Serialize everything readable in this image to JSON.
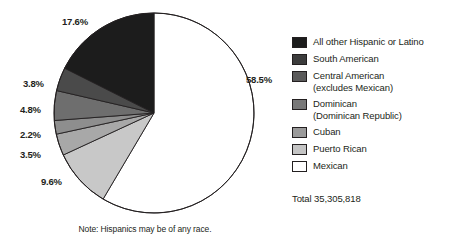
{
  "chart_data": {
    "type": "pie",
    "title": "",
    "subtitle": "",
    "total_label": "Total 35,305,818",
    "total_value": 35305818,
    "note": "Note: Hispanics may be of any race.",
    "legend_position": "right",
    "start_angle_deg": 0,
    "direction": "clockwise",
    "categories": [
      "All other Hispanic or Latino",
      "South American",
      "Central American (excludes Mexican)",
      "Dominican (Dominican Republic)",
      "Cuban",
      "Puerto Rican",
      "Mexican"
    ],
    "values": [
      17.6,
      3.8,
      4.8,
      2.2,
      3.5,
      9.6,
      58.5
    ],
    "unit": "percent",
    "slices": [
      {
        "label": "Mexican",
        "pct_text": "58.5%",
        "value": 58.5,
        "color": "#ffffff",
        "label_x": 246,
        "label_y": 74
      },
      {
        "label": "Puerto Rican",
        "pct_text": "9.6%",
        "value": 9.6,
        "color": "#c8c8c8",
        "label_x": 41,
        "label_y": 176
      },
      {
        "label": "Cuban",
        "pct_text": "3.5%",
        "value": 3.5,
        "color": "#a8a8a8",
        "label_x": 20,
        "label_y": 149
      },
      {
        "label": "Dominican (Dominican Republic)",
        "pct_text": "2.2%",
        "value": 2.2,
        "color": "#8e8e8e",
        "label_x": 20,
        "label_y": 129
      },
      {
        "label": "Central American (excludes Mexican)",
        "pct_text": "4.8%",
        "value": 4.8,
        "color": "#6e6e6e",
        "label_x": 20,
        "label_y": 104
      },
      {
        "label": "South American",
        "pct_text": "3.8%",
        "value": 3.8,
        "color": "#4a4a4a",
        "label_x": 23,
        "label_y": 78
      },
      {
        "label": "All other Hispanic or Latino",
        "pct_text": "17.6%",
        "value": 17.6,
        "color": "#1c1c1c",
        "label_x": 62,
        "label_y": 16
      }
    ]
  },
  "legend": {
    "items": [
      {
        "label": "All other Hispanic or Latino",
        "line2": "",
        "color": "#1c1c1c"
      },
      {
        "label": "South American",
        "line2": "",
        "color": "#3c3c3c"
      },
      {
        "label": "Central American",
        "line2": "(excludes Mexican)",
        "color": "#5a5a5a"
      },
      {
        "label": "Dominican",
        "line2": "(Dominican Republic)",
        "color": "#787878"
      },
      {
        "label": "Cuban",
        "line2": "",
        "color": "#9a9a9a"
      },
      {
        "label": "Puerto Rican",
        "line2": "",
        "color": "#c4c4c4"
      },
      {
        "label": "Mexican",
        "line2": "",
        "color": "#ffffff"
      }
    ]
  }
}
